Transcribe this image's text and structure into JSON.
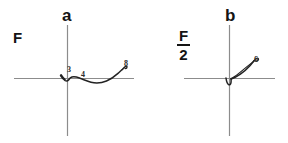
{
  "figure": {
    "background_color": "#ffffff",
    "ink_color": "#1a1a1a",
    "axis_color": "#8c8c8c",
    "curve_color": "#222222",
    "width": 288,
    "height": 143
  },
  "panels": [
    {
      "id": "a",
      "letter": "a",
      "force_label": {
        "type": "plain",
        "text": "F"
      },
      "axes": {
        "origin_x": 67,
        "origin_y": 78,
        "x_axis_start": 14,
        "x_axis_end": 134,
        "y_axis_top": 25,
        "y_axis_bottom": 136
      },
      "curve_description": "hand-drawn trajectory: small hook left of origin, shallow dip below the x-axis, then rising to a short hooked tail at upper right",
      "point_labels": [
        {
          "text": "3",
          "x": 67,
          "y": 66
        },
        {
          "text": "4",
          "x": 81,
          "y": 71
        },
        {
          "text": "8",
          "x": 124,
          "y": 61
        }
      ]
    },
    {
      "id": "b",
      "letter": "b",
      "force_label": {
        "type": "fraction",
        "numerator": "F",
        "denominator": "2"
      },
      "axes": {
        "origin_x": 85,
        "origin_y": 78,
        "x_axis_start": 40,
        "x_axis_end": 131,
        "y_axis_top": 25,
        "y_axis_bottom": 136
      },
      "curve_description": "hand-drawn trajectory: small hook just below origin, then a steep loop rising to the upper right ending in a short hooked tail",
      "point_labels": [
        {
          "text": "6",
          "x": 110,
          "y": 58
        }
      ]
    }
  ]
}
